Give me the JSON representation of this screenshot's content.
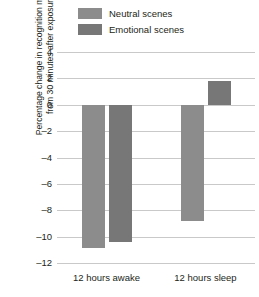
{
  "chart_data": {
    "type": "bar",
    "title": "",
    "xlabel": "",
    "ylabel": "Percentage change in recognition memory from 30 minutes after exposure",
    "ylabel_lines": [
      "Percentage change in recognition memory",
      "from 30 minutes after exposure"
    ],
    "categories": [
      "12 hours awake",
      "12 hours sleep"
    ],
    "series": [
      {
        "name": "Neutral scenes",
        "color": "#8c8c8c",
        "values": [
          -10.9,
          -8.8
        ]
      },
      {
        "name": "Emotional scenes",
        "color": "#777777",
        "values": [
          -10.4,
          1.8
        ]
      }
    ],
    "ylim": [
      -12,
      4
    ],
    "yticks": [
      4,
      2,
      0,
      -2,
      -4,
      -6,
      -8,
      -10,
      -12
    ],
    "ytick_labels": [
      "4",
      "2",
      "0",
      "–2",
      "–4",
      "–6",
      "–8",
      "–10",
      "–12"
    ],
    "grid": true,
    "legend_position": "top"
  },
  "legend": {
    "items": [
      {
        "label": "Neutral scenes",
        "color": "#8c8c8c"
      },
      {
        "label": "Emotional scenes",
        "color": "#777777"
      }
    ]
  },
  "colors": {
    "gridline": "#c9c9c9",
    "text": "#231f20",
    "background": "#ffffff"
  }
}
